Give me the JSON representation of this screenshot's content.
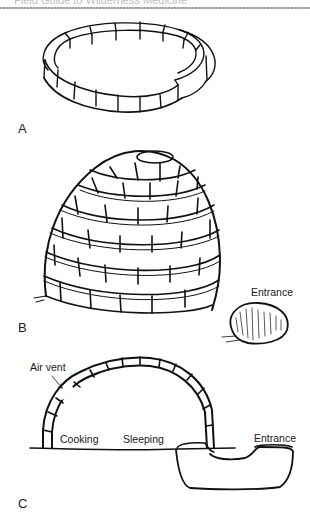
{
  "header": {
    "running_title": "Field Guide to Wilderness Medicine"
  },
  "figure": {
    "panels": [
      {
        "id": "A",
        "label": "A",
        "depicts": "ring of snow blocks (first course)"
      },
      {
        "id": "B",
        "label": "B",
        "depicts": "completed igloo dome with entrance block",
        "callouts": [
          "Entrance"
        ]
      },
      {
        "id": "C",
        "label": "C",
        "depicts": "igloo cross-section",
        "callouts": [
          "Air vent",
          "Cooking",
          "Sleeping",
          "Entrance"
        ]
      }
    ],
    "labels": {
      "panel_a": "A",
      "panel_b": "B",
      "panel_c": "C",
      "b_entrance": "Entrance",
      "c_air_vent": "Air vent",
      "c_cooking": "Cooking",
      "c_sleeping": "Sleeping",
      "c_entrance": "Entrance"
    },
    "colors": {
      "ink": "#111111",
      "paper": "#ffffff",
      "rule": "#9a9a9a"
    }
  }
}
